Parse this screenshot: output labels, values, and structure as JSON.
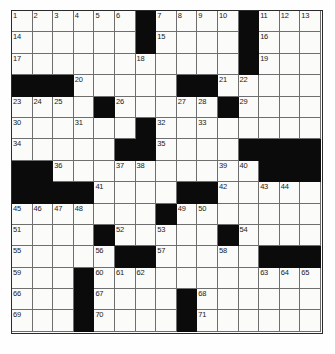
{
  "puzzle": {
    "title": "Crossword Grid",
    "type": "crossword",
    "rows": 15,
    "cols": 15,
    "colors": {
      "block": "#0b0b0b",
      "cell": "#fbfbfa",
      "grid_line": "#6e6e6e",
      "number_text": "#1a1a1a",
      "background": "#ffffff"
    },
    "legend": {
      "black_squares_label": "block",
      "white_squares_label": "open"
    },
    "grid": [
      [
        {
          "n": "1"
        },
        {
          "n": "2"
        },
        {
          "n": "3"
        },
        {
          "n": "4"
        },
        {
          "n": "5"
        },
        {
          "n": "6"
        },
        {
          "b": true
        },
        {
          "n": "7"
        },
        {
          "n": "8"
        },
        {
          "n": "9"
        },
        {
          "n": "10"
        },
        {
          "b": true
        },
        {
          "n": "11"
        },
        {
          "n": "12"
        },
        {
          "n": "13"
        }
      ],
      [
        {
          "n": "14"
        },
        {},
        {},
        {},
        {},
        {},
        {
          "b": true
        },
        {
          "n": "15"
        },
        {},
        {},
        {},
        {
          "b": true
        },
        {
          "n": "16"
        },
        {},
        {}
      ],
      [
        {
          "n": "17"
        },
        {},
        {},
        {},
        {},
        {},
        {
          "n": "18"
        },
        {},
        {},
        {},
        {},
        {
          "b": true
        },
        {
          "n": "19"
        },
        {},
        {}
      ],
      [
        {
          "b": true
        },
        {
          "b": true
        },
        {
          "b": true
        },
        {
          "n": "20"
        },
        {},
        {},
        {},
        {},
        {
          "b": true
        },
        {
          "b": true
        },
        {
          "n": "21"
        },
        {
          "n": "22"
        },
        {},
        {},
        {}
      ],
      [
        {
          "n": "23"
        },
        {
          "n": "24"
        },
        {
          "n": "25"
        },
        {},
        {
          "b": true
        },
        {
          "n": "26"
        },
        {},
        {},
        {
          "n": "27"
        },
        {
          "n": "28"
        },
        {
          "b": true
        },
        {
          "n": "29"
        },
        {},
        {},
        {}
      ],
      [
        {
          "n": "30"
        },
        {},
        {},
        {
          "n": "31"
        },
        {},
        {},
        {
          "b": true
        },
        {
          "n": "32"
        },
        {},
        {
          "n": "33"
        },
        {},
        {},
        {},
        {},
        {}
      ],
      [
        {
          "n": "34"
        },
        {},
        {},
        {},
        {},
        {
          "b": true
        },
        {
          "b": true
        },
        {
          "n": "35"
        },
        {},
        {},
        {},
        {
          "b": true
        },
        {
          "b": true
        },
        {
          "b": true
        },
        {
          "b": true
        }
      ],
      [
        {
          "b": true
        },
        {
          "b": true
        },
        {
          "n": "36"
        },
        {},
        {},
        {
          "n": "37"
        },
        {
          "n": "38"
        },
        {},
        {},
        {},
        {
          "n": "39"
        },
        {
          "n": "40"
        },
        {
          "b": true
        },
        {
          "b": true
        },
        {
          "b": true
        }
      ],
      [
        {
          "b": true
        },
        {
          "b": true
        },
        {
          "b": true
        },
        {
          "b": true
        },
        {
          "n": "41"
        },
        {},
        {},
        {},
        {
          "b": true
        },
        {
          "b": true
        },
        {
          "n": "42"
        },
        {},
        {
          "n": "43"
        },
        {
          "n": "44"
        },
        {}
      ],
      [
        {
          "n": "45"
        },
        {
          "n": "46"
        },
        {
          "n": "47"
        },
        {
          "n": "48"
        },
        {},
        {},
        {},
        {
          "b": true
        },
        {
          "n": "49"
        },
        {
          "n": "50"
        },
        {},
        {},
        {},
        {},
        {}
      ],
      [
        {
          "n": "51"
        },
        {},
        {},
        {},
        {
          "b": true
        },
        {
          "n": "52"
        },
        {},
        {
          "n": "53"
        },
        {},
        {},
        {
          "b": true
        },
        {
          "n": "54"
        },
        {},
        {},
        {}
      ],
      [
        {
          "n": "55"
        },
        {},
        {},
        {},
        {
          "n": "56"
        },
        {
          "b": true
        },
        {
          "b": true
        },
        {
          "n": "57"
        },
        {},
        {},
        {
          "n": "58"
        },
        {},
        {
          "b": true
        },
        {
          "b": true
        },
        {
          "b": true
        }
      ],
      [
        {
          "n": "59"
        },
        {},
        {},
        {
          "b": true
        },
        {
          "n": "60"
        },
        {
          "n": "61"
        },
        {
          "n": "62"
        },
        {},
        {},
        {},
        {},
        {},
        {
          "n": "63"
        },
        {
          "n": "64"
        },
        {
          "n": "65"
        }
      ],
      [
        {
          "n": "66"
        },
        {},
        {},
        {
          "b": true
        },
        {
          "n": "67"
        },
        {},
        {},
        {},
        {
          "b": true
        },
        {
          "n": "68"
        },
        {},
        {},
        {},
        {},
        {}
      ],
      [
        {
          "n": "69"
        },
        {},
        {},
        {
          "b": true
        },
        {
          "n": "70"
        },
        {},
        {},
        {},
        {
          "b": true
        },
        {
          "n": "71"
        },
        {},
        {},
        {},
        {},
        {}
      ]
    ]
  }
}
